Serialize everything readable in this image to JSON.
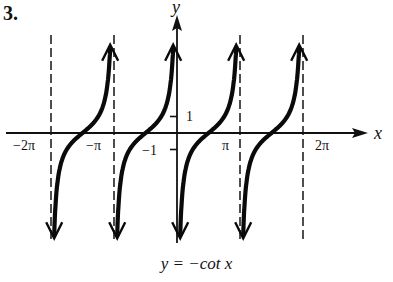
{
  "problem_number": "3.",
  "chart_data": {
    "type": "line",
    "title": "y = −cot x",
    "function": "y = -cot(x)",
    "xlabel": "x",
    "ylabel": "y",
    "x_ticks": [
      {
        "value": -6.2832,
        "label": "−2π"
      },
      {
        "value": -3.1416,
        "label": "−π"
      },
      {
        "value": 3.1416,
        "label": "π"
      },
      {
        "value": 6.2832,
        "label": "2π"
      }
    ],
    "y_ticks": [
      {
        "value": 1,
        "label": "1"
      },
      {
        "value": -1,
        "label": "−1"
      }
    ],
    "vertical_asymptotes": [
      -6.2832,
      -3.1416,
      0,
      3.1416,
      6.2832
    ],
    "asymptote_style": "dashed",
    "branches": [
      {
        "interval": [
          -6.2832,
          -3.1416
        ],
        "zero_at": -4.7124
      },
      {
        "interval": [
          -3.1416,
          0
        ],
        "zero_at": -1.5708
      },
      {
        "interval": [
          0,
          3.1416
        ],
        "zero_at": 1.5708
      },
      {
        "interval": [
          3.1416,
          6.2832
        ],
        "zero_at": 4.7124
      }
    ],
    "xlim": [
      -7.0,
      7.5
    ],
    "ylim": [
      -6.5,
      5.8
    ],
    "grid": false,
    "legend": null
  },
  "caption": "y = −cot x"
}
